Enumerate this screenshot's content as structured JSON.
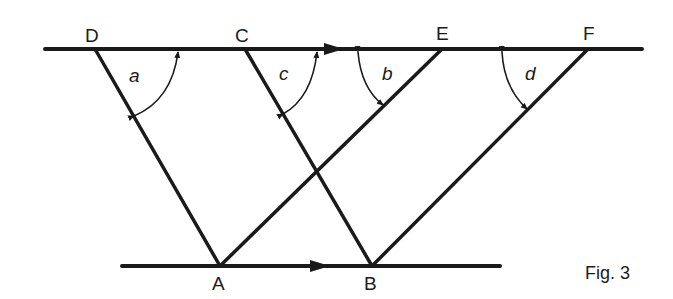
{
  "figure": {
    "caption": "Fig. 3",
    "colors": {
      "ink": "#1a1a1a",
      "background": "#ffffff"
    },
    "top_line": {
      "y": 49,
      "x1": 45,
      "x2": 642,
      "arrow_x": 335
    },
    "bottom_line": {
      "y": 266,
      "x1": 122,
      "x2": 500,
      "arrow_x": 322
    },
    "points": {
      "D": {
        "label": "D",
        "x": 95,
        "y": 49
      },
      "C": {
        "label": "C",
        "x": 245,
        "y": 49
      },
      "E": {
        "label": "E",
        "x": 442,
        "y": 49
      },
      "F": {
        "label": "F",
        "x": 588,
        "y": 49
      },
      "A": {
        "label": "A",
        "x": 220,
        "y": 266
      },
      "B": {
        "label": "B",
        "x": 372,
        "y": 266
      }
    },
    "segments": [
      [
        "D",
        "A"
      ],
      [
        "C",
        "B"
      ],
      [
        "A",
        "E"
      ],
      [
        "B",
        "F"
      ]
    ],
    "angles": [
      {
        "label": "a",
        "vertex": "D"
      },
      {
        "label": "c",
        "vertex": "C"
      },
      {
        "label": "b",
        "vertex": "E"
      },
      {
        "label": "d",
        "vertex": "F"
      }
    ]
  }
}
